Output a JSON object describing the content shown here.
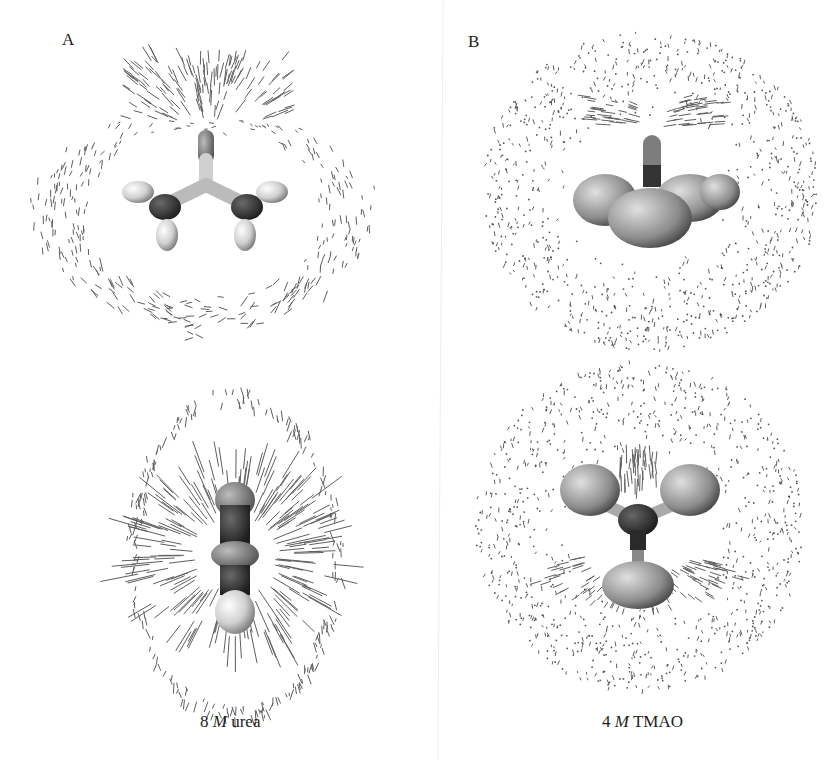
{
  "figure": {
    "panels": [
      {
        "label": "A",
        "caption_number": "8",
        "caption_unit": "M",
        "caption_solute": "urea",
        "views": [
          "top view: urea molecule with solvent dipole field",
          "side view: urea molecule edge-on with radial solvent dipole field"
        ]
      },
      {
        "label": "B",
        "caption_number": "4",
        "caption_unit": "M",
        "caption_solute": "TMAO",
        "views": [
          "side view: TMAO molecule with solvent dipole field",
          "top view: TMAO molecule trefoil with solvent dipole field"
        ]
      }
    ]
  },
  "colors": {
    "background": "#ffffff",
    "text": "#222222",
    "molecule_dark": "#333333",
    "molecule_mid": "#8a8a8a",
    "molecule_light": "#d8d8d8",
    "field_lines": "#555555"
  }
}
